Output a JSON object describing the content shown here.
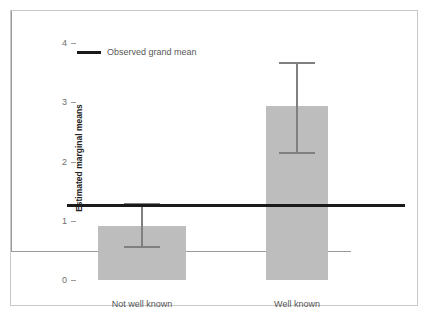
{
  "chart_data": {
    "type": "bar",
    "title": "",
    "xlabel": "",
    "ylabel": "Estimated marginal means",
    "categories": [
      "Not well known",
      "Well known"
    ],
    "values": [
      0.91,
      2.94
    ],
    "error_low": [
      0.57,
      2.16
    ],
    "error_high": [
      1.3,
      3.68
    ],
    "yticks": [
      0,
      1,
      2,
      3,
      4
    ],
    "ylim": [
      0,
      4
    ],
    "grid": false,
    "legend_position": "top-left",
    "annotations": [
      {
        "name": "observed-grand-mean",
        "label": "Observed grand mean",
        "value": 1.27,
        "type": "hline"
      }
    ],
    "colors": {
      "bar_fill": "#bdbdbd",
      "error_bar": "#808080",
      "grand_mean_line": "#1a1a1a",
      "axis": "#9a9a9a",
      "tick_text": "#6e6e6e",
      "frame_border": "#c8c8c8"
    }
  },
  "legend": {
    "grand_mean_label": "Observed grand mean"
  },
  "axes": {
    "y_title": "Estimated marginal means",
    "y_tick_labels": [
      "0",
      "1",
      "2",
      "3",
      "4"
    ],
    "x_tick_labels": [
      "Not well known",
      "Well known"
    ]
  }
}
